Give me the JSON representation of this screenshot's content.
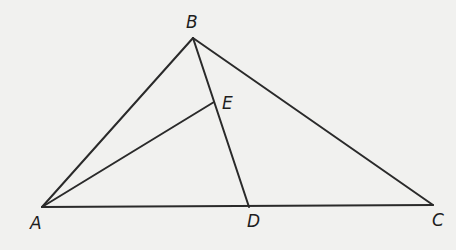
{
  "diagram": {
    "type": "geometry-triangle",
    "points": {
      "A": {
        "label": "A",
        "x": 42,
        "y": 207,
        "lx": 30,
        "ly": 229
      },
      "B": {
        "label": "B",
        "x": 193,
        "y": 38,
        "lx": 186,
        "ly": 28
      },
      "C": {
        "label": "C",
        "x": 433,
        "y": 205,
        "lx": 432,
        "ly": 226
      },
      "D": {
        "label": "D",
        "x": 249,
        "y": 207,
        "lx": 247,
        "ly": 227
      },
      "E": {
        "label": "E",
        "x": 214,
        "y": 102,
        "lx": 222,
        "ly": 109
      }
    },
    "segments": [
      {
        "name": "AB",
        "from": "A",
        "to": "B"
      },
      {
        "name": "BC",
        "from": "B",
        "to": "C"
      },
      {
        "name": "AC",
        "from": "A",
        "to": "C"
      },
      {
        "name": "BD",
        "from": "B",
        "to": "D"
      },
      {
        "name": "AE",
        "from": "A",
        "to": "E"
      }
    ],
    "colors": {
      "line": "#2a2a2a",
      "background": "#f1f1ef",
      "text": "#1e1e1e"
    }
  }
}
